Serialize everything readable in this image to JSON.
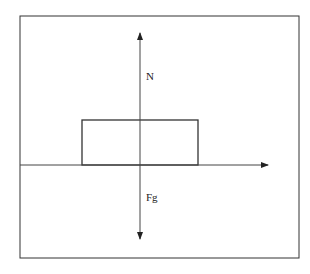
{
  "diagram": {
    "type": "free-body diagram",
    "labels": {
      "normal_force": "N",
      "gravity_force": "Fg"
    },
    "colors": {
      "stroke": "#333333",
      "background": "#ffffff"
    }
  }
}
